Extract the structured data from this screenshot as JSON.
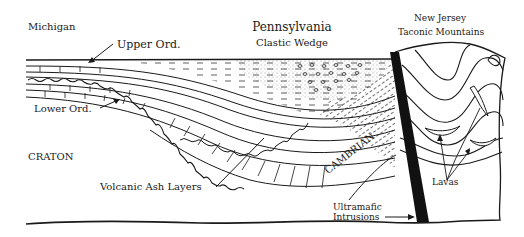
{
  "diagram": {
    "type": "geologic-cross-section",
    "labels": {
      "michigan": "Michigan",
      "upper_ord": "Upper Ord.",
      "lower_ord": "Lower Ord.",
      "craton": "CRATON",
      "pennsylvania": "Pennsylvania",
      "clastic_wedge": "Clastic Wedge",
      "new_jersey": "New Jersey",
      "taconic_mountains": "Taconic Mountains",
      "volcanic_ash_layers": "Volcanic Ash Layers",
      "cambrian": "CAMBRIAN",
      "lavas": "Lavas",
      "ultramafic_line1": "Ultramafic",
      "ultramafic_line2": "Intrusions"
    },
    "colors": {
      "ink": "#1a1a1a",
      "background": "#ffffff"
    }
  }
}
